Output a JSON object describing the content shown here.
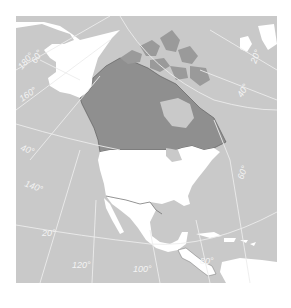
{
  "map": {
    "title": "North America — Canada highlighted",
    "colors": {
      "ocean": "#c9c9c9",
      "land": "#ffffff",
      "highlight_canada": "#8f8f8f",
      "arctic_islands": "#9a9a9a",
      "graticule": "#ececec",
      "border": "#555555",
      "label": "#f4f4f4"
    },
    "regions": {
      "highlighted": "Canada",
      "other_land": [
        "Alaska",
        "United States",
        "Mexico",
        "Central America",
        "Caribbean",
        "Greenland"
      ]
    },
    "graticule_labels": {
      "lon_180": "180°",
      "lat_60_nw": "60°",
      "lon_160": "160°",
      "lat_40_w": "40°",
      "lon_140": "140°",
      "lat_20_w": "20°",
      "lon_120": "120°",
      "lon_100": "100°",
      "lon_80": "80°",
      "lon_60": "60°",
      "lat_40_ne": "40°",
      "lon_20_ne": "20°"
    }
  }
}
